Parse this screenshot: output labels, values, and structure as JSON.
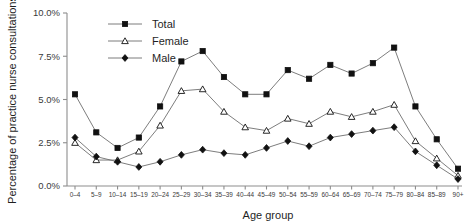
{
  "chart_data": {
    "type": "line",
    "title": "",
    "xlabel": "Age group",
    "ylabel": "Percentage of practice nurse consultations",
    "ylim": [
      0,
      10
    ],
    "ytick_labels": [
      "0.0%",
      "2.5%",
      "5.0%",
      "7.5%",
      "10.0%"
    ],
    "ytick_values": [
      0,
      2.5,
      5.0,
      7.5,
      10.0
    ],
    "grid": false,
    "legend_position": "top-left-inside",
    "categories": [
      "0–4",
      "5–9",
      "10–14",
      "15–19",
      "20–24",
      "25–29",
      "30–34",
      "35–39",
      "40–44",
      "45–49",
      "50–54",
      "55–59",
      "60–64",
      "65–69",
      "70–74",
      "75–79",
      "80–84",
      "85–89",
      "90+"
    ],
    "series": [
      {
        "name": "Total",
        "marker": "filled-square",
        "values": [
          5.3,
          3.1,
          2.2,
          2.8,
          4.6,
          7.2,
          7.8,
          6.3,
          5.3,
          5.3,
          6.7,
          6.2,
          7.0,
          6.5,
          7.1,
          8.0,
          4.6,
          2.7,
          1.0
        ]
      },
      {
        "name": "Female",
        "marker": "open-triangle",
        "values": [
          2.5,
          1.5,
          1.5,
          2.0,
          3.5,
          5.5,
          5.6,
          4.3,
          3.4,
          3.2,
          3.9,
          3.6,
          4.3,
          4.0,
          4.3,
          4.7,
          2.6,
          1.6,
          0.6
        ]
      },
      {
        "name": "Male",
        "marker": "filled-diamond",
        "values": [
          2.8,
          1.7,
          1.4,
          1.1,
          1.4,
          1.8,
          2.1,
          1.9,
          1.8,
          2.2,
          2.6,
          2.3,
          2.8,
          3.0,
          3.2,
          3.4,
          2.0,
          1.2,
          0.4
        ]
      }
    ]
  },
  "legend": {
    "items": [
      {
        "label": "Total"
      },
      {
        "label": "Female"
      },
      {
        "label": "Male"
      }
    ]
  },
  "axes": {
    "x_title": "Age group",
    "y_title": "Percentage of practice nurse consultations"
  },
  "colors": {
    "line": "#6e6e6e",
    "marker": "#111111",
    "axis": "#8d8d8d",
    "text": "#1f1f1f",
    "background": "#ffffff"
  }
}
